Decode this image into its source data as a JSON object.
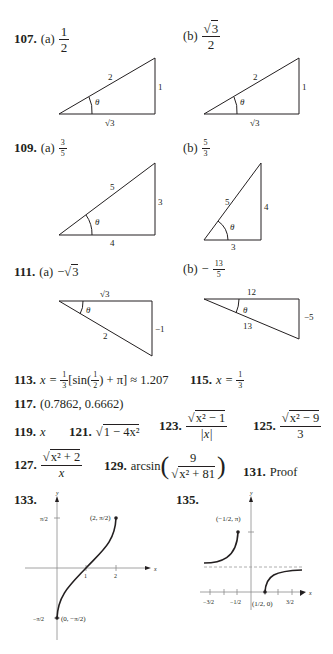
{
  "answers": {
    "a107": {
      "number": "107.",
      "a_label": "(a)",
      "a_num": "1",
      "a_den": "2",
      "b_label": "(b)",
      "b_num": "3",
      "b_den": "2",
      "triangle_a": {
        "hyp": "2",
        "opp": "1",
        "adj": "3",
        "angle": "θ"
      },
      "triangle_b": {
        "hyp": "2",
        "opp": "1",
        "adj": "3",
        "angle": "θ"
      }
    },
    "a109": {
      "number": "109.",
      "a_label": "(a)",
      "a_num": "3",
      "a_den": "5",
      "b_label": "(b)",
      "b_num": "5",
      "b_den": "3",
      "triangle_a": {
        "hyp": "5",
        "opp": "3",
        "adj": "4",
        "angle": "θ"
      },
      "triangle_b": {
        "hyp": "5",
        "opp": "4",
        "adj": "3",
        "angle": "θ"
      }
    },
    "a111": {
      "number": "111.",
      "a_label": "(a)",
      "a_value": "−",
      "a_root": "3",
      "b_label": "(b)",
      "b_sign": "−",
      "b_num": "13",
      "b_den": "5",
      "triangle_a": {
        "top": "3",
        "hyp": "2",
        "side": "−1",
        "angle": "θ"
      },
      "triangle_b": {
        "top": "12",
        "hyp": "13",
        "side": "−5",
        "angle": "θ"
      }
    },
    "a113": {
      "number": "113.",
      "lhs": "x = ",
      "f_num": "1",
      "f_den": "3",
      "sin": "sin",
      "h_num": "1",
      "h_den": "2",
      "plus_pi": " + π",
      "approx": " ≈ 1.207"
    },
    "a115": {
      "number": "115.",
      "lhs": "x = ",
      "f_num": "1",
      "f_den": "3"
    },
    "a117": {
      "number": "117.",
      "value": "(0.7862, 0.6662)"
    },
    "a119": {
      "number": "119.",
      "value": "x"
    },
    "a121": {
      "number": "121.",
      "radicand": "1 − 4x²"
    },
    "a123": {
      "number": "123.",
      "num_radicand": "x² − 1",
      "den": "|x|"
    },
    "a125": {
      "number": "125.",
      "num_radicand": "x² − 9",
      "den": "3"
    },
    "a127": {
      "number": "127.",
      "num_radicand": "x² + 2",
      "den": "x"
    },
    "a129": {
      "number": "129.",
      "func": "arcsin",
      "num": "9",
      "den_radicand": "x² + 81"
    },
    "a131": {
      "number": "131.",
      "value": "Proof"
    },
    "a133": {
      "number": "133.",
      "y_label": "y",
      "x_label": "x",
      "y_tick_top": "π/2",
      "y_tick_bottom": "−π/2",
      "x_tick_1": "1",
      "x_tick_2": "2",
      "point_top": "(2, π/2)",
      "point_bottom": "(0, −π/2)"
    },
    "a135": {
      "number": "135.",
      "y_label": "y",
      "x_label": "x",
      "x_ticks": [
        "−3/2",
        "−1/2",
        "1/2",
        "3/2"
      ],
      "point_top": "(−1/2, π)",
      "point_bottom": "(1/2, 0)"
    }
  }
}
